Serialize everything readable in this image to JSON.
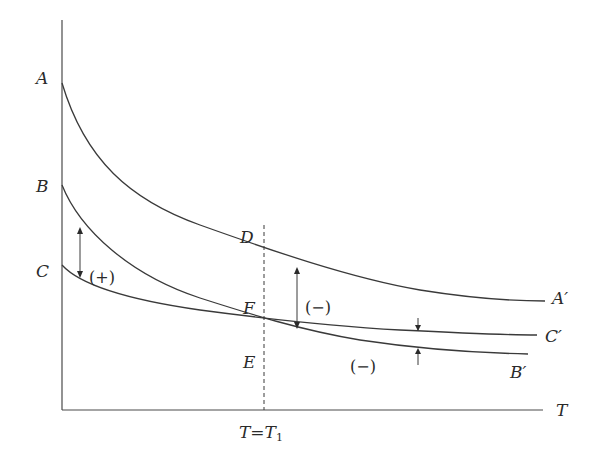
{
  "diagram": {
    "axes": {
      "x_label": "T",
      "marker_label": "T=T",
      "marker_subscript": "1"
    },
    "curves": {
      "A": {
        "start_label": "A",
        "end_label": "A′"
      },
      "B": {
        "start_label": "B",
        "end_label": "B′"
      },
      "C": {
        "start_label": "C",
        "end_label": "C′"
      }
    },
    "points": {
      "D": "D",
      "F": "F",
      "E": "E"
    },
    "annotations": {
      "left_gap_sign": "(+)",
      "middle_gap_sign": "(−)",
      "right_gap_sign": "(−)"
    }
  }
}
